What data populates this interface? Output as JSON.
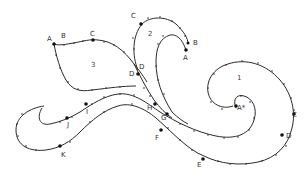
{
  "diagram": {
    "title": "",
    "regions": [
      {
        "id": "region-1",
        "label": "1",
        "x": 237,
        "y": 80
      },
      {
        "id": "region-2",
        "label": "2",
        "x": 148,
        "y": 36
      },
      {
        "id": "region-3",
        "label": "3",
        "x": 91,
        "y": 67
      }
    ],
    "labels": [
      {
        "id": "label-a-left",
        "text": "A",
        "x": 47,
        "y": 41
      },
      {
        "id": "label-b-left",
        "text": "B",
        "x": 61,
        "y": 38
      },
      {
        "id": "label-c-left",
        "text": "C",
        "x": 90,
        "y": 36
      },
      {
        "id": "label-c-top",
        "text": "C",
        "x": 131,
        "y": 18
      },
      {
        "id": "label-a-top",
        "text": "A",
        "x": 183,
        "y": 60
      },
      {
        "id": "label-b-top",
        "text": "B",
        "x": 193,
        "y": 45
      },
      {
        "id": "label-d-upper",
        "text": "D",
        "x": 139,
        "y": 69
      },
      {
        "id": "label-d-lower",
        "text": "D",
        "x": 129,
        "y": 76
      },
      {
        "id": "label-h",
        "text": "H",
        "x": 147,
        "y": 110
      },
      {
        "id": "label-g",
        "text": "G",
        "x": 161,
        "y": 120
      },
      {
        "id": "label-f",
        "text": "F",
        "x": 155,
        "y": 140
      },
      {
        "id": "label-e",
        "text": "E",
        "x": 197,
        "y": 167
      },
      {
        "id": "label-a-star",
        "text": "A*",
        "x": 237,
        "y": 110
      },
      {
        "id": "label-c-right",
        "text": "C",
        "x": 292,
        "y": 117
      },
      {
        "id": "label-d-right",
        "text": "D",
        "x": 286,
        "y": 138
      },
      {
        "id": "label-i",
        "text": "I",
        "x": 86,
        "y": 114
      },
      {
        "id": "label-j",
        "text": "J",
        "x": 67,
        "y": 127
      },
      {
        "id": "label-k",
        "text": "K",
        "x": 61,
        "y": 157
      }
    ],
    "colors": {
      "stroke": "#2a2a2a",
      "background": "#ffffff"
    }
  }
}
